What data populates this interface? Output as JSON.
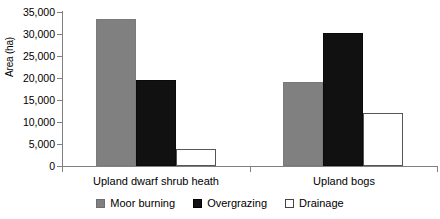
{
  "chart_data": {
    "type": "bar",
    "title": "",
    "xlabel": "",
    "ylabel": "Area (ha)",
    "categories": [
      "Upland dwarf shrub heath",
      "Upland bogs"
    ],
    "series": [
      {
        "name": "Moor burning",
        "color": "#808080",
        "values": [
          33500,
          19000
        ]
      },
      {
        "name": "Overgrazing",
        "color": "#111111",
        "values": [
          19500,
          30300
        ]
      },
      {
        "name": "Drainage",
        "color": "#ffffff",
        "values": [
          3900,
          12100
        ]
      }
    ],
    "ylim": [
      0,
      35000
    ],
    "yticks": [
      0,
      5000,
      10000,
      15000,
      20000,
      25000,
      30000,
      35000
    ],
    "ytick_labels": [
      "0",
      "5,000",
      "10,000",
      "15,000",
      "20,000",
      "25,000",
      "30,000",
      "35,000"
    ],
    "grid": false,
    "legend_position": "bottom"
  }
}
